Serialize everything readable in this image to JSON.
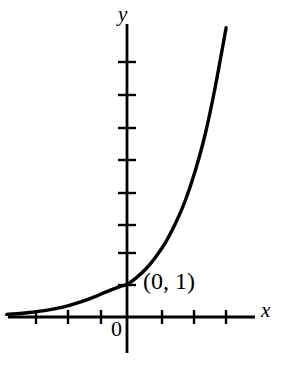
{
  "figure": {
    "background_color": "#ffffff",
    "ink_color": "#000000",
    "width": 286,
    "height": 375
  },
  "labels": {
    "y_axis": "y",
    "x_axis": "x",
    "origin": "0",
    "point_annotation": "(0, 1)"
  },
  "axes": {
    "origin_px": {
      "x": 127,
      "y": 317
    },
    "unit_px": 32.5,
    "x_axis": {
      "start_px": 8,
      "end_px": 255,
      "tick_positions_px": [
        36,
        68,
        101,
        162,
        194,
        226
      ],
      "tick_values": [
        -3,
        -2,
        -1,
        1,
        2,
        3
      ],
      "tick_half_length_px": 7
    },
    "y_axis": {
      "start_px": 24,
      "end_px": 353,
      "tick_positions_px": [
        62,
        95,
        128,
        160,
        193,
        225,
        253,
        285
      ],
      "tick_values": [
        8,
        7,
        6,
        5,
        4,
        3,
        2,
        1
      ],
      "tick_half_length_px": 9
    },
    "stroke_width_px": 2.6
  },
  "chart_data": {
    "type": "line",
    "title": "",
    "xlabel": "x",
    "ylabel": "y",
    "xlim": [
      -3.7,
      3.9
    ],
    "ylim": [
      -1.1,
      9.0
    ],
    "grid": false,
    "legend": null,
    "annotations": [
      {
        "text": "(0, 1)",
        "x": 0,
        "y": 1,
        "note": "y-intercept of the exponential curve"
      },
      {
        "text": "0",
        "x": 0,
        "y": 0,
        "note": "origin label"
      }
    ],
    "series": [
      {
        "name": "y = b^x  (b > 1, exponential growth)",
        "curve_kind": "exponential",
        "color": "#000000",
        "line_width_px": 3.4,
        "x": [
          -3.7,
          -3.4,
          -3.0,
          -2.6,
          -2.2,
          -1.8,
          -1.4,
          -1.0,
          -0.6,
          -0.2,
          0.0,
          0.3,
          0.6,
          0.9,
          1.2,
          1.5,
          1.8,
          2.1,
          2.4,
          2.7,
          3.05
        ],
        "y": [
          0.08,
          0.1,
          0.14,
          0.19,
          0.26,
          0.35,
          0.47,
          0.62,
          0.79,
          0.94,
          1.0,
          1.22,
          1.5,
          1.87,
          2.32,
          2.9,
          3.6,
          4.5,
          5.6,
          7.0,
          8.9
        ]
      }
    ]
  }
}
